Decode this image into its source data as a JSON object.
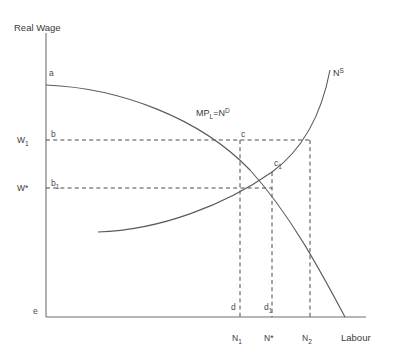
{
  "figure": {
    "type": "diagram",
    "background_color": "#ffffff",
    "line_color": "#5a5a5a",
    "text_color": "#3a3a3a"
  },
  "axes": {
    "y_axis_title": "Real Wage",
    "x_axis_title": "Labour",
    "origin_label": "e",
    "y_axis_x_px": 46,
    "y_axis_top_px": 33,
    "x_axis_y_px": 317,
    "x_axis_right_px": 366
  },
  "y_ticks": [
    {
      "name": "w1",
      "label": "W",
      "sub": "1",
      "value_y_px": 140
    },
    {
      "name": "wstar",
      "label": "W*",
      "sub": "",
      "value_y_px": 188
    }
  ],
  "x_ticks": [
    {
      "name": "n1",
      "label": "N",
      "sub": "1",
      "value_x_px": 240
    },
    {
      "name": "nstar",
      "label": "N*",
      "sub": "",
      "value_x_px": 272
    },
    {
      "name": "n2",
      "label": "N",
      "sub": "2",
      "value_x_px": 310
    }
  ],
  "curves": [
    {
      "name": "labour-demand-curve",
      "label_main": "MP",
      "label_sub": "L",
      "label_eq": "=N",
      "label_sup": "D",
      "label_x_px": 196,
      "label_y_px": 116,
      "path": "M 46 85 C 120 88, 200 118, 250 170 C 290 214, 320 270, 345 317",
      "description": "downward sloping marginal product of labour / labour demand"
    },
    {
      "name": "labour-supply-curve",
      "label_main": "N",
      "label_sub": "",
      "label_eq": "",
      "label_sup": "S",
      "label_x_px": 333,
      "label_y_px": 76,
      "path": "M 98 232 C 160 230, 225 205, 272 172 C 305 148, 322 112, 330 70",
      "description": "upward sloping labour supply"
    }
  ],
  "points": [
    {
      "name": "point-a",
      "label": "a",
      "sub": "",
      "x_px": 49,
      "y_px": 76,
      "description": "intercept of demand curve on the wage axis"
    },
    {
      "name": "point-b",
      "label": "b",
      "sub": "",
      "x_px": 51,
      "y_px": 137,
      "description": "wage axis point at W1"
    },
    {
      "name": "point-b1",
      "label": "b",
      "sub": "1",
      "x_px": 51,
      "y_px": 186,
      "description": "wage axis point at W*"
    },
    {
      "name": "point-c",
      "label": "c",
      "sub": "",
      "x_px": 241,
      "y_px": 137,
      "description": "demand curve at wage W1, employment N1"
    },
    {
      "name": "point-c1",
      "label": "c",
      "sub": "1",
      "x_px": 274,
      "y_px": 166,
      "description": "equilibrium where supply meets demand at W*, N*"
    },
    {
      "name": "point-d",
      "label": "d",
      "sub": "",
      "x_px": 234,
      "y_px": 310,
      "description": "labour axis point at N1"
    },
    {
      "name": "point-d1",
      "label": "d",
      "sub": "1",
      "x_px": 268,
      "y_px": 310,
      "description": "labour axis point at N*"
    },
    {
      "name": "point-e",
      "label": "e",
      "sub": "",
      "x_px": 33,
      "y_px": 314,
      "description": "origin"
    }
  ],
  "guide_lines": [
    {
      "name": "w1-horizontal-guide",
      "x1": 46,
      "y1": 140,
      "x2": 311,
      "y2": 140
    },
    {
      "name": "wstar-horizontal-guide",
      "x1": 46,
      "y1": 188,
      "x2": 272,
      "y2": 188
    },
    {
      "name": "n1-vertical-guide",
      "x1": 240,
      "y1": 140,
      "x2": 240,
      "y2": 317
    },
    {
      "name": "nstar-vertical-guide",
      "x1": 272,
      "y1": 172,
      "x2": 272,
      "y2": 317
    },
    {
      "name": "n2-vertical-guide",
      "x1": 310,
      "y1": 140,
      "x2": 310,
      "y2": 317
    }
  ]
}
